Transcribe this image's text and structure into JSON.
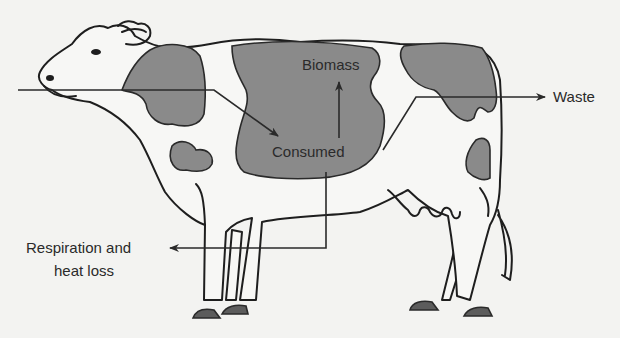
{
  "diagram": {
    "type": "energy-flow",
    "labels": {
      "biomass": "Biomass",
      "consumed": "Consumed",
      "waste": "Waste",
      "respiration_line1": "Respiration and",
      "respiration_line2": "heat loss"
    },
    "flows": [
      {
        "from": "food-input",
        "to": "Consumed"
      },
      {
        "from": "Consumed",
        "to": "Biomass"
      },
      {
        "from": "Consumed",
        "to": "Waste"
      },
      {
        "from": "Consumed",
        "to": "Respiration and heat loss"
      }
    ],
    "colors": {
      "background": "#f3f3f1",
      "spot": "#8a8a8a",
      "hoof": "#5c5c5c",
      "ink": "#1e1e1e"
    }
  }
}
